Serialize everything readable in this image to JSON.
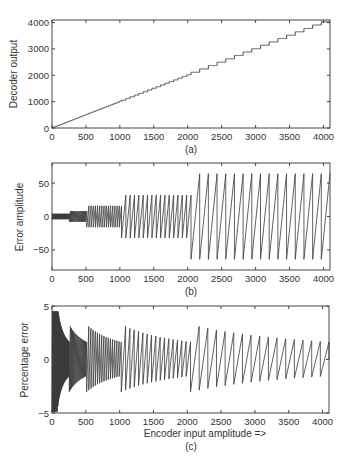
{
  "chart_data": [
    {
      "id": "a",
      "type": "line",
      "caption": "(a)",
      "title": "",
      "xlabel": "",
      "ylabel": "Decoder output",
      "xlim": [
        0,
        4096
      ],
      "ylim": [
        0,
        4096
      ],
      "xticks": [
        0,
        500,
        1000,
        1500,
        2000,
        2500,
        3000,
        3500,
        4000
      ],
      "xtick_labels": [
        "0",
        "500",
        "1000",
        "1500",
        "2000",
        "2500",
        "3000",
        "3500",
        "4000"
      ],
      "yticks": [
        0,
        1000,
        2000,
        3000,
        4000
      ],
      "ytick_labels": [
        "0",
        "1000",
        "2000",
        "3000",
        "4000"
      ],
      "grid": false,
      "description": "Staircase quantizer transfer: decoder output vs encoder input; step widths 2,4,8,16,32,64 in successive segments (fine steps below 1024), 64-wide steps 1024-2048, 128-wide steps 2048-4096",
      "series": [
        {
          "name": "Decoder output",
          "x": [
            0,
            512,
            1024,
            1536,
            2048,
            2560,
            3072,
            3584,
            4096
          ],
          "values": [
            0,
            512,
            1024,
            1536,
            2048,
            2560,
            3072,
            3584,
            4032
          ]
        }
      ],
      "segments": [
        {
          "x_start": 0,
          "x_end": 256,
          "step": 8
        },
        {
          "x_start": 256,
          "x_end": 512,
          "step": 16
        },
        {
          "x_start": 512,
          "x_end": 1024,
          "step": 32
        },
        {
          "x_start": 1024,
          "x_end": 2048,
          "step": 64
        },
        {
          "x_start": 2048,
          "x_end": 4096,
          "step": 128
        }
      ]
    },
    {
      "id": "b",
      "type": "line",
      "caption": "(b)",
      "title": "",
      "xlabel": "",
      "ylabel": "Error amplitude",
      "xlim": [
        0,
        4096
      ],
      "ylim": [
        -80,
        80
      ],
      "xticks": [
        0,
        500,
        1000,
        1500,
        2000,
        2500,
        3000,
        3500,
        4000
      ],
      "xtick_labels": [
        "0",
        "500",
        "1000",
        "1500",
        "2000",
        "2500",
        "3000",
        "3500",
        "4000"
      ],
      "yticks": [
        -50,
        0,
        50
      ],
      "ytick_labels": [
        "−50",
        "0",
        "50"
      ],
      "grid": false,
      "description": "Sawtooth quantization error; amplitude roughly +/-4 (0-256), +/-8 (256-512), +/-16 (512-1024), +/-32 (1024-2048), +/-64 (2048-4096)",
      "series": [
        {
          "name": "Error amplitude",
          "x": [
            128,
            384,
            768,
            1536,
            3072
          ],
          "values": [
            4,
            8,
            16,
            32,
            64
          ]
        }
      ],
      "segments": [
        {
          "x_start": 0,
          "x_end": 256,
          "step": 8,
          "amp": 4
        },
        {
          "x_start": 256,
          "x_end": 512,
          "step": 16,
          "amp": 8
        },
        {
          "x_start": 512,
          "x_end": 1024,
          "step": 32,
          "amp": 16
        },
        {
          "x_start": 1024,
          "x_end": 2048,
          "step": 64,
          "amp": 32
        },
        {
          "x_start": 2048,
          "x_end": 4096,
          "step": 128,
          "amp": 64
        }
      ]
    },
    {
      "id": "c",
      "type": "line",
      "caption": "(c)",
      "title": "",
      "xlabel": "Encoder input amplitude =>",
      "ylabel": "Percentage error",
      "xlim": [
        0,
        4096
      ],
      "ylim": [
        -5,
        5
      ],
      "xticks": [
        0,
        500,
        1000,
        1500,
        2000,
        2500,
        3000,
        3500,
        4000
      ],
      "xtick_labels": [
        "0",
        "500",
        "1000",
        "1500",
        "2000",
        "2500",
        "3000",
        "3500",
        "4000"
      ],
      "yticks": [
        -5,
        0,
        5
      ],
      "ytick_labels": [
        "−5",
        "0",
        "5"
      ],
      "grid": false,
      "description": "Percentage error = error/input*100; peaks ~3% at start of each segment decaying to ~1.5% at segment end",
      "series": [
        {
          "name": "Peak percentage error",
          "x": [
            128,
            256,
            512,
            1024,
            2048,
            4096
          ],
          "values": [
            3.0,
            2.5,
            2.8,
            2.8,
            2.9,
            1.6
          ]
        }
      ],
      "segments": [
        {
          "x_start": 0,
          "x_end": 256,
          "step": 8
        },
        {
          "x_start": 256,
          "x_end": 512,
          "step": 16
        },
        {
          "x_start": 512,
          "x_end": 1024,
          "step": 32
        },
        {
          "x_start": 1024,
          "x_end": 2048,
          "step": 64
        },
        {
          "x_start": 2048,
          "x_end": 4096,
          "step": 128
        }
      ]
    }
  ],
  "labels": {
    "a": {
      "caption": "(a)",
      "ylabel": "Decoder output"
    },
    "b": {
      "caption": "(b)",
      "ylabel": "Error amplitude"
    },
    "c": {
      "caption": "(c)",
      "ylabel": "Percentage error",
      "xlabel": "Encoder input amplitude =>"
    }
  },
  "colors": {
    "line": "#3a3a3a",
    "axis": "#444444",
    "text": "#333333"
  }
}
